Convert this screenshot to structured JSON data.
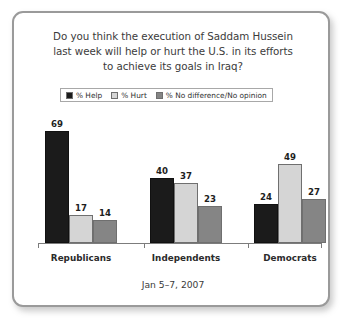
{
  "card": {
    "border_color": "#9a9a9a",
    "background": "#ffffff"
  },
  "chart_data": {
    "type": "bar",
    "title": "Do you think the execution of Saddam Hussein last week will help or hurt the U.S. in its efforts to achieve its goals in Iraq?",
    "title_lines": [
      "Do you think the execution of Saddam Hussein",
      "last week will help or hurt the U.S. in its efforts",
      "to achieve its goals in Iraq?"
    ],
    "subtitle": "",
    "footer": "Jan 5–7, 2007",
    "xlabel": "",
    "ylabel": "",
    "ylim": [
      0,
      72
    ],
    "grid": false,
    "legend_position": "top-center",
    "categories": [
      "Republicans",
      "Independents",
      "Democrats"
    ],
    "series": [
      {
        "name": "% Help",
        "color": "#1b1b1b",
        "values": [
          69,
          40,
          24
        ]
      },
      {
        "name": "% Hurt",
        "color": "#d5d5d5",
        "values": [
          17,
          37,
          49
        ]
      },
      {
        "name": "% No difference/No opinion",
        "color": "#858585",
        "values": [
          14,
          23,
          27
        ]
      }
    ]
  }
}
